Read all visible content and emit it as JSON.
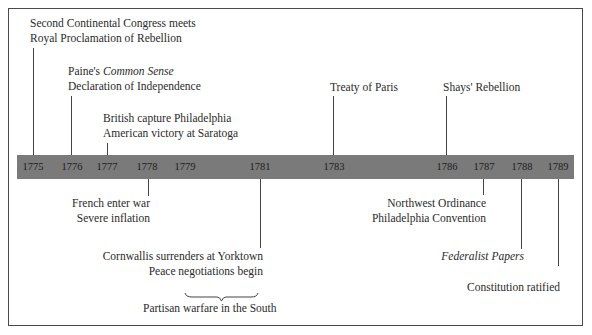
{
  "diagram": {
    "type": "timeline",
    "colors": {
      "bar": "#7a7a7a",
      "line": "#444444",
      "text": "#2a2a2a",
      "frame": "#4a4a4a"
    },
    "years": [
      "1775",
      "1776",
      "1777",
      "1778",
      "1779",
      "1781",
      "1783",
      "1786",
      "1787",
      "1788",
      "1789"
    ],
    "above": [
      {
        "year": "1775",
        "lines": [
          "Second Continental Congress meets",
          "Royal Proclamation of Rebellion"
        ]
      },
      {
        "year": "1776",
        "line1_prefix": "Paine's ",
        "line1_italic": "Common Sense",
        "line2": "Declaration of Independence"
      },
      {
        "year": "1777",
        "lines": [
          "British capture Philadelphia",
          "American victory at Saratoga"
        ]
      },
      {
        "year": "1783",
        "lines": [
          "Treaty of Paris"
        ]
      },
      {
        "year": "1786",
        "lines": [
          "Shays' Rebellion"
        ]
      }
    ],
    "below": [
      {
        "year": "1778",
        "lines": [
          "French enter war",
          "Severe inflation"
        ]
      },
      {
        "year": "1781",
        "lines": [
          "Cornwallis surrenders at Yorktown",
          "Peace negotiations begin"
        ]
      },
      {
        "year": "1787",
        "lines": [
          "Northwest Ordinance",
          "Philadelphia Convention"
        ]
      },
      {
        "year": "1788",
        "italic": "Federalist Papers"
      },
      {
        "year": "1789",
        "lines": [
          "Constitution ratified"
        ]
      }
    ],
    "span": {
      "from": "1779",
      "to": "1781",
      "label": "Partisan  warfare in the South"
    }
  }
}
